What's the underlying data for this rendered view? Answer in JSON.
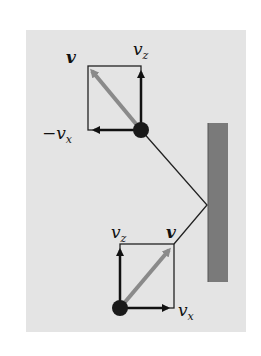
{
  "figure": {
    "top_vectors": {
      "v_label": "v",
      "vz_label": "v",
      "vz_sub": "z",
      "vx_label": "−v",
      "vx_sub": "x"
    },
    "bottom_vectors": {
      "v_label": "v",
      "vz_label": "v",
      "vz_sub": "z",
      "vx_label": "v",
      "vx_sub": "x"
    },
    "colors": {
      "panel": "#e4e4e4",
      "wall": "#7a7a7a",
      "velocity_arrow": "#8a8a8a",
      "component_arrows": "#111111",
      "ball": "#1a1a1a"
    }
  }
}
